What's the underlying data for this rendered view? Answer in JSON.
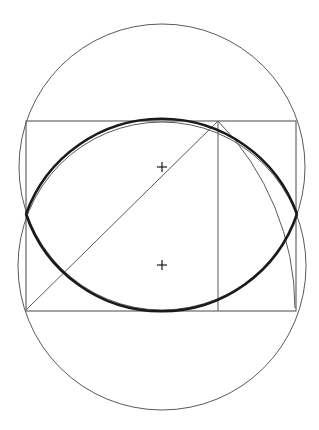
{
  "diagram": {
    "title": "",
    "background": "#ffffff",
    "colors": {
      "thin_stroke": "#5a5a5a",
      "thick_stroke": "#1a1a1a"
    },
    "upper_circle": {
      "cx": 162,
      "cy": 167,
      "r": 143
    },
    "lower_circle": {
      "cx": 162,
      "cy": 266,
      "r": 144
    },
    "rectangle": {
      "x1": 26,
      "y1": 121,
      "x2": 296,
      "y2": 311
    },
    "vertical_line": {
      "x": 218,
      "y1": 121,
      "y2": 311
    },
    "diagonal_line": {
      "x1": 26,
      "y1": 310,
      "x2": 218,
      "y2": 121
    },
    "swing_arc": {
      "cx": 26,
      "cy": 310,
      "r": 269,
      "from": [
        218,
        121
      ],
      "to": [
        295,
        308
      ]
    },
    "ellipse_vertices": {
      "left": [
        26,
        214
      ],
      "right": [
        297,
        214
      ]
    },
    "center_marks": [
      {
        "label": "upper-center",
        "x": 162,
        "y": 167
      },
      {
        "label": "lower-center",
        "x": 162,
        "y": 265
      }
    ]
  }
}
